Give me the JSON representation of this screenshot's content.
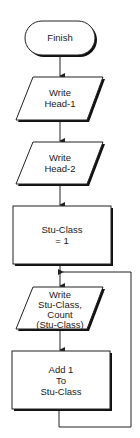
{
  "flowchart": {
    "nodes": [
      {
        "id": "finish",
        "type": "terminator",
        "lines": [
          "Finish"
        ]
      },
      {
        "id": "write-head-1",
        "type": "io",
        "lines": [
          "Write",
          "Head-1"
        ]
      },
      {
        "id": "write-head-2",
        "type": "io",
        "lines": [
          "Write",
          "Head-2"
        ]
      },
      {
        "id": "init-stu-class",
        "type": "process",
        "lines": [
          "Stu-Class",
          "= 1"
        ]
      },
      {
        "id": "write-stu-class-count",
        "type": "io",
        "lines": [
          "Write",
          "Stu-Class,",
          "Count",
          "(Stu-Class)"
        ]
      },
      {
        "id": "add-1-stu-class",
        "type": "process",
        "lines": [
          "Add 1",
          "To",
          "Stu-Class"
        ]
      }
    ],
    "edges": [
      {
        "from": "finish",
        "to": "write-head-1"
      },
      {
        "from": "write-head-1",
        "to": "write-head-2"
      },
      {
        "from": "write-head-2",
        "to": "init-stu-class"
      },
      {
        "from": "init-stu-class",
        "to": "write-stu-class-count"
      },
      {
        "from": "write-stu-class-count",
        "to": "add-1-stu-class"
      },
      {
        "from": "add-1-stu-class",
        "to": "write-stu-class-count",
        "kind": "loop-back"
      }
    ],
    "colors": {
      "stroke": "#222222",
      "shadow": "#111111",
      "fill": "#ffffff",
      "text": "#222222"
    }
  }
}
